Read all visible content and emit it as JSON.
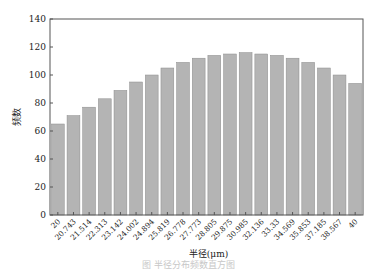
{
  "chart_data": {
    "type": "bar",
    "title": "",
    "xlabel": "半径(μm)",
    "ylabel": "频数",
    "ylim": [
      0,
      140
    ],
    "yticks": [
      0,
      20,
      40,
      60,
      80,
      100,
      120,
      140
    ],
    "grid": false,
    "legend": null,
    "categories": [
      "20",
      "20.743",
      "21.514",
      "22.313",
      "23.142",
      "24.002",
      "24.894",
      "25.819",
      "26.778",
      "27.773",
      "28.805",
      "29.875",
      "30.985",
      "32.136",
      "33.33",
      "34.569",
      "35.853",
      "37.185",
      "38.567",
      "40"
    ],
    "values": [
      65,
      71,
      77,
      83,
      89,
      95,
      100,
      105,
      109,
      112,
      114,
      115,
      116,
      115,
      114,
      112,
      109,
      105,
      100,
      94
    ],
    "bar_color": "#b4b4b4",
    "bar_edge_color": "#8c8c8c",
    "frame_color": "#555555"
  },
  "caption": "图 半径分布频数直方图"
}
